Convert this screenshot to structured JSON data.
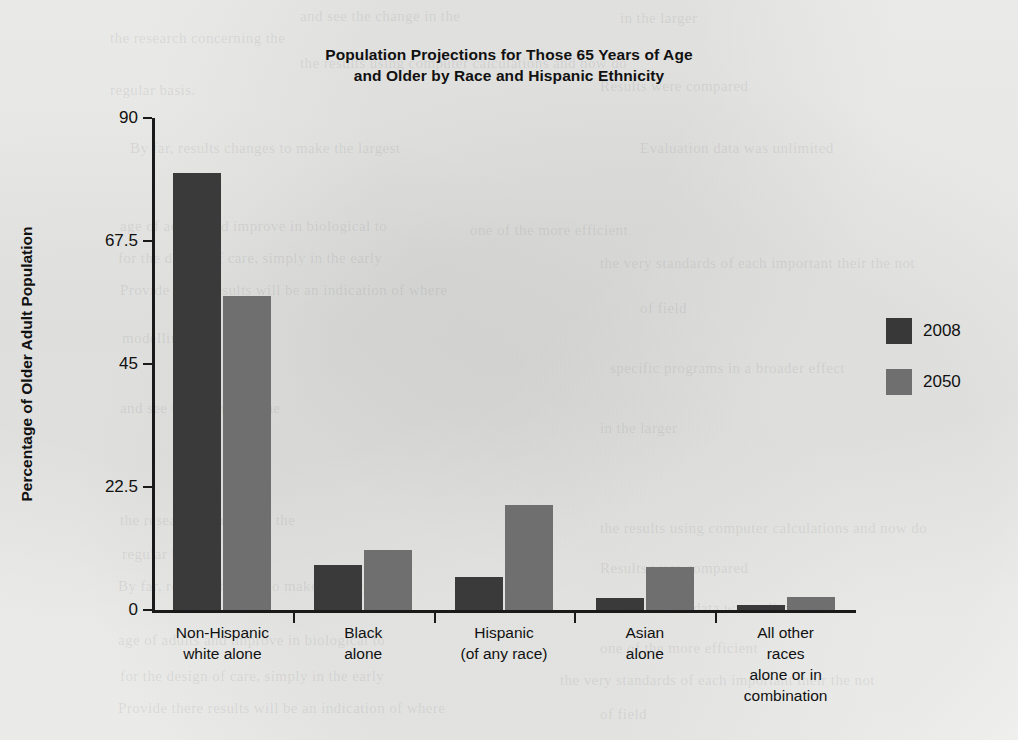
{
  "chart_data": {
    "type": "bar",
    "title": "Population Projections for Those 65 Years of Age and Older by Race and Hispanic Ethnicity",
    "title_line1": "Population Projections for Those 65 Years of Age",
    "title_line2": "and Older by Race and Hispanic Ethnicity",
    "xlabel": "",
    "ylabel": "Percentage of Older Adult Population",
    "ylim": [
      0,
      90
    ],
    "yticks": [
      "0",
      "22.5",
      "45",
      "67.5",
      "90"
    ],
    "ytick_values": [
      0,
      22.5,
      45,
      67.5,
      90
    ],
    "grid": false,
    "legend_position": "right",
    "categories": [
      "Non-Hispanic\nwhite alone",
      "Black\nalone",
      "Hispanic\n(of any race)",
      "Asian\nalone",
      "All other races\nalone or in\ncombination"
    ],
    "series": [
      {
        "name": "2008",
        "color": "#3a3a3a",
        "values": [
          80.0,
          8.3,
          6.0,
          2.2,
          1.0
        ]
      },
      {
        "name": "2050",
        "color": "#6f6f6f",
        "values": [
          57.5,
          11.0,
          19.2,
          7.8,
          2.3
        ]
      }
    ]
  },
  "legend": {
    "items": [
      {
        "label": "2008",
        "color": "#3a3a3a"
      },
      {
        "label": "2050",
        "color": "#6f6f6f"
      }
    ]
  },
  "background_text": {
    "ghosts": [
      "and see the change in the",
      "in the larger",
      "the research concerning the",
      "the results using computer calculations and now do",
      "regular basis.",
      "Results were compared",
      "By far, results changes to make the largest",
      "Evaluation data was unlimited",
      "age of adults and improve in biological to",
      "one of the more efficient",
      "for the design of care, simply in the early",
      "the very standards of each important their the not",
      "Provide there results will be an indication of where",
      "of field",
      "modelling",
      "specific programs in a broader effect"
    ]
  }
}
